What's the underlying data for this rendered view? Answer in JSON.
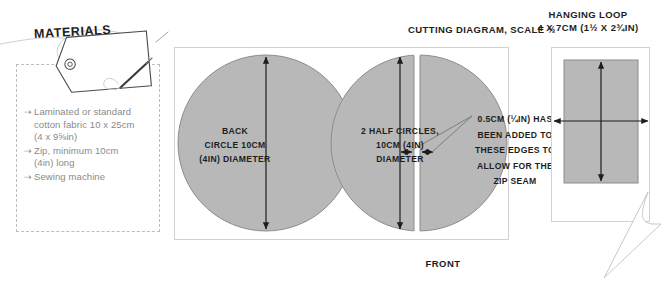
{
  "page": {
    "background": "#ffffff",
    "shape_fill": "#b8b8b8",
    "shape_stroke": "#6e6e6e",
    "ink": "#1d1d1d",
    "muted": "#8a8a8a"
  },
  "materials": {
    "tag_label": "MATERIALS",
    "items": [
      {
        "bullet": "⇢",
        "text": "Laminated or standard\ncotton fabric 10 x 25cm\n(4 x 9⅝in)"
      },
      {
        "bullet": "⇢",
        "text": "Zip, minimum 10cm\n(4in) long"
      },
      {
        "bullet": "⇢",
        "text": "Sewing machine"
      }
    ]
  },
  "cutting_diagram": {
    "title": "CUTTING DIAGRAM, SCALE ½",
    "front_label": "FRONT",
    "back_circle_label": "BACK\nCIRCLE 10CM\n(4IN) DIAMETER",
    "half_circles_label": "2 HALF CIRCLES,\n10CM (4IN)\nDIAMETER",
    "zip_seam_note": "0.5CM (¼IN) HAS\nBEEN ADDED TO\nTHESE EDGES TO\nALLOW FOR THE\nZIP SEAM"
  },
  "hanging_loop": {
    "title_line1": "HANGING LOOP",
    "title_line2": "4 X 7CM (1½ X 2¾IN)"
  }
}
